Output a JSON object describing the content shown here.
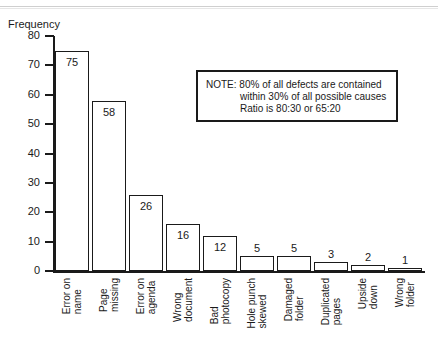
{
  "chart_data": {
    "type": "bar",
    "title": "",
    "xlabel": "",
    "ylabel": "Frequency",
    "ylim": [
      0,
      80
    ],
    "yticks": [
      "0",
      "10",
      "20",
      "30",
      "40",
      "50",
      "60",
      "70",
      "80"
    ],
    "grid": false,
    "legend": "none",
    "categories": [
      "Error on name",
      "Page missing",
      "Error on agenda",
      "Wrong document",
      "Bad photocopy",
      "Hole punch skewed",
      "Damaged folder",
      "Duplicated pages",
      "Upside down",
      "Wrong folder"
    ],
    "category_lines": [
      [
        "Error on",
        "name"
      ],
      [
        "Page",
        "missing"
      ],
      [
        "Error on",
        "agenda"
      ],
      [
        "Wrong",
        "document"
      ],
      [
        "Bad",
        "photocopy"
      ],
      [
        "Hole punch",
        "skewed"
      ],
      [
        "Damaged",
        "folder"
      ],
      [
        "Duplicated",
        "pages"
      ],
      [
        "Upside",
        "down"
      ],
      [
        "Wrong",
        "folder"
      ]
    ],
    "values": [
      75,
      58,
      26,
      16,
      12,
      5,
      5,
      3,
      2,
      1
    ],
    "value_labels": [
      "75",
      "58",
      "26",
      "16",
      "12",
      "5",
      "5",
      "3",
      "2",
      "1"
    ],
    "annotations": [
      {
        "name": "note",
        "lines": [
          "NOTE:  80% of all defects are contained",
          "within 30% of all possible causes",
          "Ratio is 80:30 or 65:20"
        ]
      }
    ]
  },
  "colors": {
    "ink": "#1a1a1a",
    "paper": "#ffffff"
  }
}
